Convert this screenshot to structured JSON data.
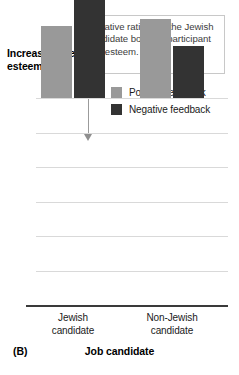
{
  "chart_data": {
    "type": "bar",
    "title": "",
    "panel_label": "(B)",
    "xlabel": "Job candidate",
    "ylabel": "Increase in self-esteem",
    "ylim": [
      0,
      6
    ],
    "yticks": [
      0,
      1,
      2,
      3,
      4,
      5,
      6
    ],
    "ytick_labels": [
      "0",
      "1",
      "2",
      "3",
      "4",
      "5",
      "6"
    ],
    "grid": true,
    "legend_position": "top-right",
    "categories": [
      "Jewish candidate",
      "Non-Jewish candidate"
    ],
    "category_lines": [
      [
        "Jewish",
        "candidate"
      ],
      [
        "Non-Jewish",
        "candidate"
      ]
    ],
    "series": [
      {
        "name": "Positive feedback",
        "color": "#999999",
        "values": [
          2.1,
          2.3
        ]
      },
      {
        "name": "Negative feedback",
        "color": "#333333",
        "values": [
          4.8,
          1.5
        ]
      }
    ],
    "annotations": [
      {
        "text": "Negative ratings of the Jewish candidate boosted participant self-esteem.",
        "points_to": "Negative feedback bar for Jewish candidate"
      }
    ]
  },
  "legend": {
    "items": [
      {
        "label": "Positive feedback",
        "color": "#999999"
      },
      {
        "label": "Negative feedback",
        "color": "#333333"
      }
    ]
  },
  "annotation": {
    "text": "Negative ratings of the Jewish candidate boosted participant self-esteem."
  },
  "axes": {
    "y_title": "Increase in self-esteem",
    "x_title": "Job candidate"
  },
  "footer": {
    "panel": "(B)"
  }
}
